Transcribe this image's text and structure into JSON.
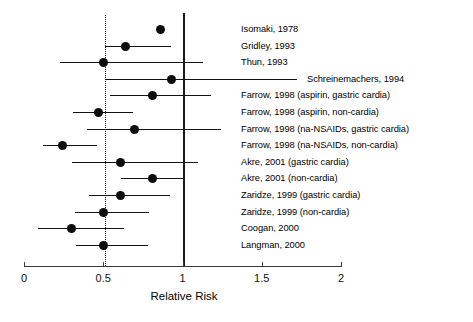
{
  "chart_data": {
    "type": "scatter",
    "subtype": "forest-plot",
    "title": "",
    "xlabel": "Relative Risk",
    "ylabel": "",
    "xlim": [
      0,
      2
    ],
    "xticks": [
      0,
      0.5,
      1,
      1.5,
      2
    ],
    "xtick_labels": [
      "0",
      "0.5",
      "1",
      "1.5",
      "2"
    ],
    "grid": false,
    "legend": null,
    "reference_lines": [
      {
        "name": "null-effect",
        "x": 1,
        "style": "solid"
      },
      {
        "name": "pooled-estimate",
        "x": 0.5,
        "style": "dotted"
      }
    ],
    "categories": [
      "Isomaki, 1978",
      "Gridley, 1993",
      "Thun, 1993",
      "Schreinemachers, 1994",
      "Farrow, 1998 (aspirin, gastric cardia)",
      "Farrow, 1998 (aspirin, non-cardia)",
      "Farrow, 1998 (na-NSAIDs, gastric cardia)",
      "Farrow, 1998 (na-NSAIDs, non-cardia)",
      "Akre, 2001 (gastric cardia)",
      "Akre, 2001 (non-cardia)",
      "Zaridze, 1999 (gastric cardia)",
      "Zaridze, 1999 (non-cardia)",
      "Coogan, 2000",
      "Langman, 2000"
    ],
    "values": [
      0.86,
      0.64,
      0.5,
      0.93,
      0.81,
      0.47,
      0.7,
      0.24,
      0.61,
      0.81,
      0.61,
      0.5,
      0.3,
      0.5
    ],
    "ci_low": [
      null,
      0.51,
      0.23,
      0.51,
      0.54,
      0.31,
      0.4,
      0.12,
      0.3,
      0.61,
      0.41,
      0.32,
      0.09,
      0.33
    ],
    "ci_high": [
      null,
      0.93,
      1.13,
      1.72,
      1.18,
      0.69,
      1.24,
      0.46,
      1.1,
      1.01,
      0.92,
      0.79,
      0.63,
      0.78
    ],
    "label_x": [
      241,
      241,
      241,
      307,
      241,
      241,
      241,
      241,
      241,
      241,
      241,
      241,
      241,
      241
    ],
    "studies": [
      {
        "label": "Isomaki, 1978",
        "rr": 0.86,
        "ci_low": null,
        "ci_high": null
      },
      {
        "label": "Gridley, 1993",
        "rr": 0.64,
        "ci_low": 0.51,
        "ci_high": 0.93
      },
      {
        "label": "Thun, 1993",
        "rr": 0.5,
        "ci_low": 0.23,
        "ci_high": 1.13
      },
      {
        "label": "Schreinemachers, 1994",
        "rr": 0.93,
        "ci_low": 0.51,
        "ci_high": 1.72
      },
      {
        "label": "Farrow, 1998 (aspirin, gastric cardia)",
        "rr": 0.81,
        "ci_low": 0.54,
        "ci_high": 1.18
      },
      {
        "label": "Farrow, 1998 (aspirin, non-cardia)",
        "rr": 0.47,
        "ci_low": 0.31,
        "ci_high": 0.69
      },
      {
        "label": "Farrow, 1998 (na-NSAIDs, gastric cardia)",
        "rr": 0.7,
        "ci_low": 0.4,
        "ci_high": 1.24
      },
      {
        "label": "Farrow, 1998 (na-NSAIDs, non-cardia)",
        "rr": 0.24,
        "ci_low": 0.12,
        "ci_high": 0.46
      },
      {
        "label": "Akre, 2001 (gastric cardia)",
        "rr": 0.61,
        "ci_low": 0.3,
        "ci_high": 1.1
      },
      {
        "label": "Akre, 2001 (non-cardia)",
        "rr": 0.81,
        "ci_low": 0.61,
        "ci_high": 1.01
      },
      {
        "label": "Zaridze, 1999 (gastric cardia)",
        "rr": 0.61,
        "ci_low": 0.41,
        "ci_high": 0.92
      },
      {
        "label": "Zaridze, 1999 (non-cardia)",
        "rr": 0.5,
        "ci_low": 0.32,
        "ci_high": 0.79
      },
      {
        "label": "Coogan, 2000",
        "rr": 0.3,
        "ci_low": 0.09,
        "ci_high": 0.63
      },
      {
        "label": "Langman, 2000",
        "rr": 0.5,
        "ci_low": 0.33,
        "ci_high": 0.78
      }
    ],
    "colors": {
      "marker": "#0d0d0d",
      "ci": "#111111",
      "axis": "#3b3b3b",
      "reference_solid": "#1a1a1a",
      "reference_dotted": "#1a1a1a",
      "background": "#ffffff",
      "text": "#000000"
    }
  }
}
